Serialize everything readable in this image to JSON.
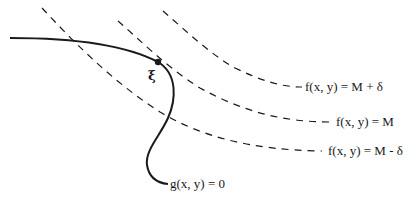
{
  "figure": {
    "point_label": "ξ",
    "constraint_label": "g(x, y) = 0",
    "level_curves": [
      {
        "label": "f(x, y) = M + δ"
      },
      {
        "label": "f(x, y) = M"
      },
      {
        "label": "f(x, y) = M - δ"
      }
    ],
    "colors": {
      "ink": "#1a1a1a",
      "background": "#ffffff"
    }
  }
}
